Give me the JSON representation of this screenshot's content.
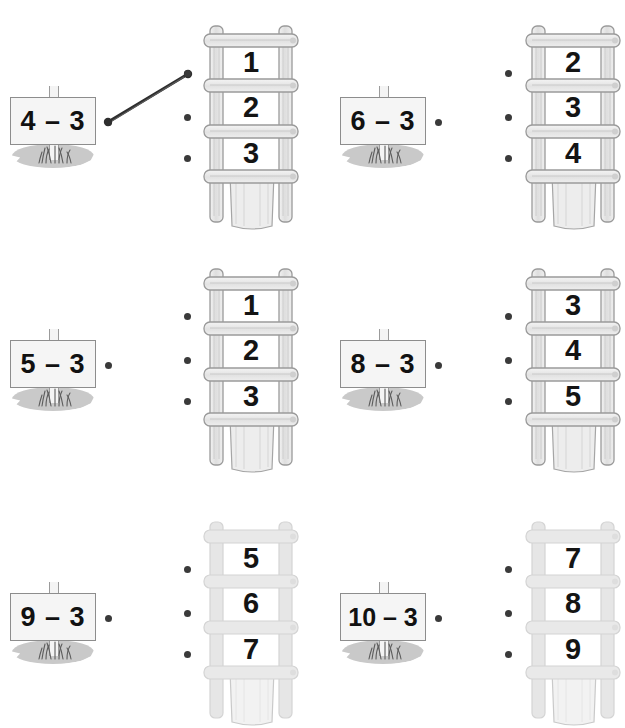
{
  "worksheet": {
    "title": "Subtraction matching worksheet",
    "instruction_visible": false,
    "columns": 2,
    "rows": 3,
    "colors": {
      "ink": "#141414",
      "dot": "#3a3a3a",
      "ladder_stroke": "#9a9a9a",
      "ladder_fill": "#e8e8e8",
      "ladder_faded_stroke": "#cfcfcf",
      "ladder_faded_fill": "#ebebeb",
      "sign_fill": "#f5f5f5",
      "sign_border": "#8d8d8d",
      "shadow": "#c9c9c9",
      "connector": "#2e2e2e",
      "background": "#ffffff"
    }
  },
  "items": [
    {
      "id": "item-1",
      "sign_label": "4 – 3",
      "ladder_numbers": [
        "1",
        "2",
        "3"
      ],
      "faded": false,
      "connected": true,
      "connection": {
        "from_dot": "sign-dot-1",
        "to_dot": "ladder-dot-1-1"
      }
    },
    {
      "id": "item-2",
      "sign_label": "6 – 3",
      "ladder_numbers": [
        "2",
        "3",
        "4"
      ],
      "faded": false,
      "connected": false,
      "connection": null
    },
    {
      "id": "item-3",
      "sign_label": "5 – 3",
      "ladder_numbers": [
        "1",
        "2",
        "3"
      ],
      "faded": false,
      "connected": false,
      "connection": null
    },
    {
      "id": "item-4",
      "sign_label": "8 – 3",
      "ladder_numbers": [
        "3",
        "4",
        "5"
      ],
      "faded": false,
      "connected": false,
      "connection": null
    },
    {
      "id": "item-5",
      "sign_label": "9 – 3",
      "ladder_numbers": [
        "5",
        "6",
        "7"
      ],
      "faded": true,
      "connected": false,
      "connection": null
    },
    {
      "id": "item-6",
      "sign_label": "10 – 3",
      "ladder_numbers": [
        "7",
        "8",
        "9"
      ],
      "faded": true,
      "connected": false,
      "connection": null
    }
  ]
}
